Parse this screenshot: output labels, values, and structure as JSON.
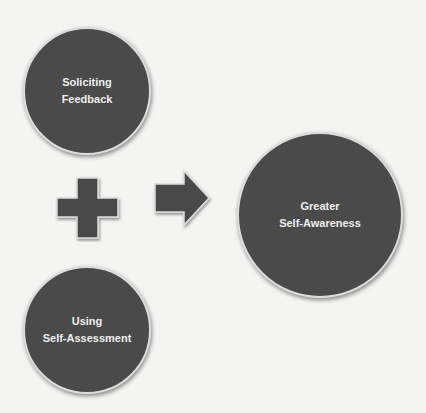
{
  "diagram": {
    "colors": {
      "background": "#f4f4f2",
      "shape_fill": "#4a4a4a",
      "shape_border": "#dcdcdc",
      "text": "#eeeeee"
    },
    "nodes": [
      {
        "id": "soliciting-feedback",
        "line1": "Soliciting",
        "line2": "Feedback"
      },
      {
        "id": "using-self-assessment",
        "line1": "Using",
        "line2": "Self-Assessment"
      },
      {
        "id": "greater-self-awareness",
        "line1": "Greater",
        "line2": "Self-Awareness"
      }
    ],
    "operators": {
      "plus": "plus-icon",
      "arrow": "right-arrow-icon"
    }
  }
}
